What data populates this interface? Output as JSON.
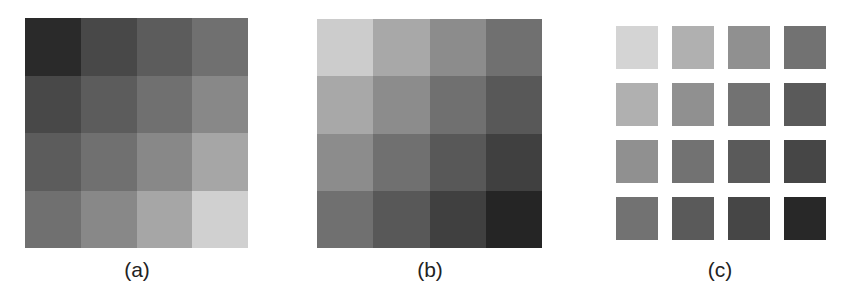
{
  "panels": [
    {
      "id": "a",
      "caption": "(a)",
      "style": "contiguous",
      "gray_levels": [
        [
          "#2a2a2a",
          "#484848",
          "#5c5c5c",
          "#707070"
        ],
        [
          "#484848",
          "#5c5c5c",
          "#707070",
          "#888888"
        ],
        [
          "#5c5c5c",
          "#707070",
          "#888888",
          "#a6a6a6"
        ],
        [
          "#707070",
          "#888888",
          "#a6a6a6",
          "#d0d0d0"
        ]
      ]
    },
    {
      "id": "b",
      "caption": "(b)",
      "style": "contiguous",
      "gray_levels": [
        [
          "#cccccc",
          "#a8a8a8",
          "#8c8c8c",
          "#707070"
        ],
        [
          "#a8a8a8",
          "#8c8c8c",
          "#707070",
          "#585858"
        ],
        [
          "#8c8c8c",
          "#707070",
          "#585858",
          "#404040"
        ],
        [
          "#707070",
          "#585858",
          "#404040",
          "#252525"
        ]
      ]
    },
    {
      "id": "c",
      "caption": "(c)",
      "style": "separated",
      "gray_levels": [
        [
          "#d4d4d4",
          "#b0b0b0",
          "#909090",
          "#727272"
        ],
        [
          "#b0b0b0",
          "#909090",
          "#727272",
          "#5a5a5a"
        ],
        [
          "#909090",
          "#727272",
          "#5a5a5a",
          "#464646"
        ],
        [
          "#727272",
          "#5a5a5a",
          "#464646",
          "#282828"
        ]
      ]
    }
  ]
}
